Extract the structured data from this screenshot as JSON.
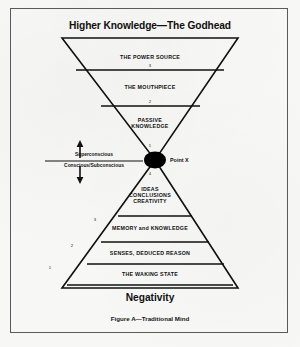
{
  "figure": {
    "title": "Higher Knowledge—The Godhead",
    "bottom_label": "Negativity",
    "caption": "Figure A—Traditional Mind",
    "point_marker_label": "Point X"
  },
  "upper_triangle": {
    "shape": "inverted-triangle",
    "bands": [
      {
        "number": "3",
        "label": "THE POWER SOURCE"
      },
      {
        "number": "2",
        "label": "THE MOUTHPIECE"
      },
      {
        "number": "1",
        "label": "PASSIVE\nKNOWLEDGE"
      }
    ]
  },
  "lower_triangle": {
    "shape": "pyramid",
    "bands": [
      {
        "number": "4",
        "label": "IDEAS\nCONCLUSIONS\nCREATIVITY"
      },
      {
        "number": "3",
        "label": "MEMORY and KNOWLEDGE"
      },
      {
        "number": "2",
        "label": "SENSES, DEDUCED REASON"
      },
      {
        "number": "1",
        "label": "THE WAKING STATE"
      }
    ]
  },
  "consciousness_key": {
    "above_line": "Superconscious",
    "below_line": "Conscious/Subconscious",
    "up_arrow": "↑",
    "down_arrow": "↓"
  },
  "colors": {
    "ink": "#111111",
    "paper": "#f7f7f5",
    "frame": "#5a5a5a",
    "marker": "#000000"
  }
}
